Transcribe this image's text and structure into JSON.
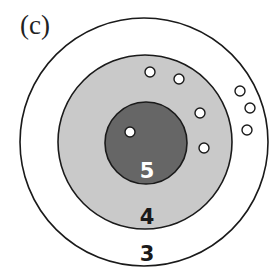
{
  "figure": {
    "panel_label": "(c)",
    "colors": {
      "outer_fill": "#ffffff",
      "middle_fill": "#c9c9c9",
      "inner_fill": "#666666",
      "stroke": "#1a1a1a",
      "dot_fill": "#ffffff"
    },
    "rings": [
      {
        "label": "3",
        "cx": 144,
        "cy": 142,
        "r": 124,
        "fill": "#ffffff"
      },
      {
        "label": "4",
        "cx": 145,
        "cy": 142,
        "r": 87,
        "fill": "#c9c9c9"
      },
      {
        "label": "5",
        "cx": 146,
        "cy": 143,
        "r": 41,
        "fill": "#666666"
      }
    ],
    "ring_labels": {
      "outer": "3",
      "middle": "4",
      "inner": "5"
    },
    "dots": [
      {
        "cx": 130,
        "cy": 132,
        "zone": "5"
      },
      {
        "cx": 150,
        "cy": 72,
        "zone": "4"
      },
      {
        "cx": 179,
        "cy": 79,
        "zone": "4"
      },
      {
        "cx": 200,
        "cy": 113,
        "zone": "4"
      },
      {
        "cx": 204,
        "cy": 148,
        "zone": "4"
      },
      {
        "cx": 240,
        "cy": 91,
        "zone": "3"
      },
      {
        "cx": 250,
        "cy": 108,
        "zone": "3"
      },
      {
        "cx": 247,
        "cy": 130,
        "zone": "3"
      }
    ]
  }
}
